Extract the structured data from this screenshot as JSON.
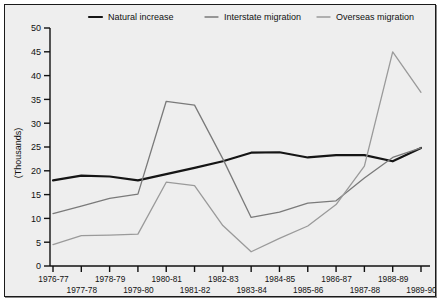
{
  "chart_data": {
    "type": "line",
    "title": "",
    "xlabel": "",
    "ylabel": "(Thousands)",
    "ylim": [
      0,
      50
    ],
    "ytick_step": 5,
    "yticks": [
      0,
      5,
      10,
      15,
      20,
      25,
      30,
      35,
      40,
      45,
      50
    ],
    "grid": false,
    "legend_position": "top",
    "categories": [
      "1976-77",
      "1977-78",
      "1978-79",
      "1979-80",
      "1980-81",
      "1981-82",
      "1982-83",
      "1983-84",
      "1984-85",
      "1985-86",
      "1986-87",
      "1987-88",
      "1988-89",
      "1989-90"
    ],
    "series": [
      {
        "name": "Natural increase",
        "color": "#151515",
        "width": 2.2,
        "values": [
          18.0,
          19.0,
          18.8,
          18.0,
          19.3,
          20.6,
          22.0,
          23.8,
          23.9,
          22.8,
          23.3,
          23.3,
          22.0,
          24.8
        ]
      },
      {
        "name": "Interstate migration",
        "color": "#7a7a7a",
        "width": 1.3,
        "values": [
          11.0,
          12.6,
          14.2,
          15.1,
          34.6,
          33.8,
          22.5,
          10.2,
          11.3,
          13.2,
          13.7,
          18.5,
          22.8,
          24.8
        ]
      },
      {
        "name": "Overseas migration",
        "color": "#9a9a9a",
        "width": 1.3,
        "values": [
          4.5,
          6.4,
          6.5,
          6.7,
          17.6,
          16.9,
          8.5,
          3.0,
          5.8,
          8.4,
          12.9,
          21.0,
          45.0,
          36.5
        ]
      }
    ]
  },
  "legend": {
    "items": [
      {
        "label": "Natural increase"
      },
      {
        "label": "Interstate migration"
      },
      {
        "label": "Overseas migration"
      }
    ]
  }
}
